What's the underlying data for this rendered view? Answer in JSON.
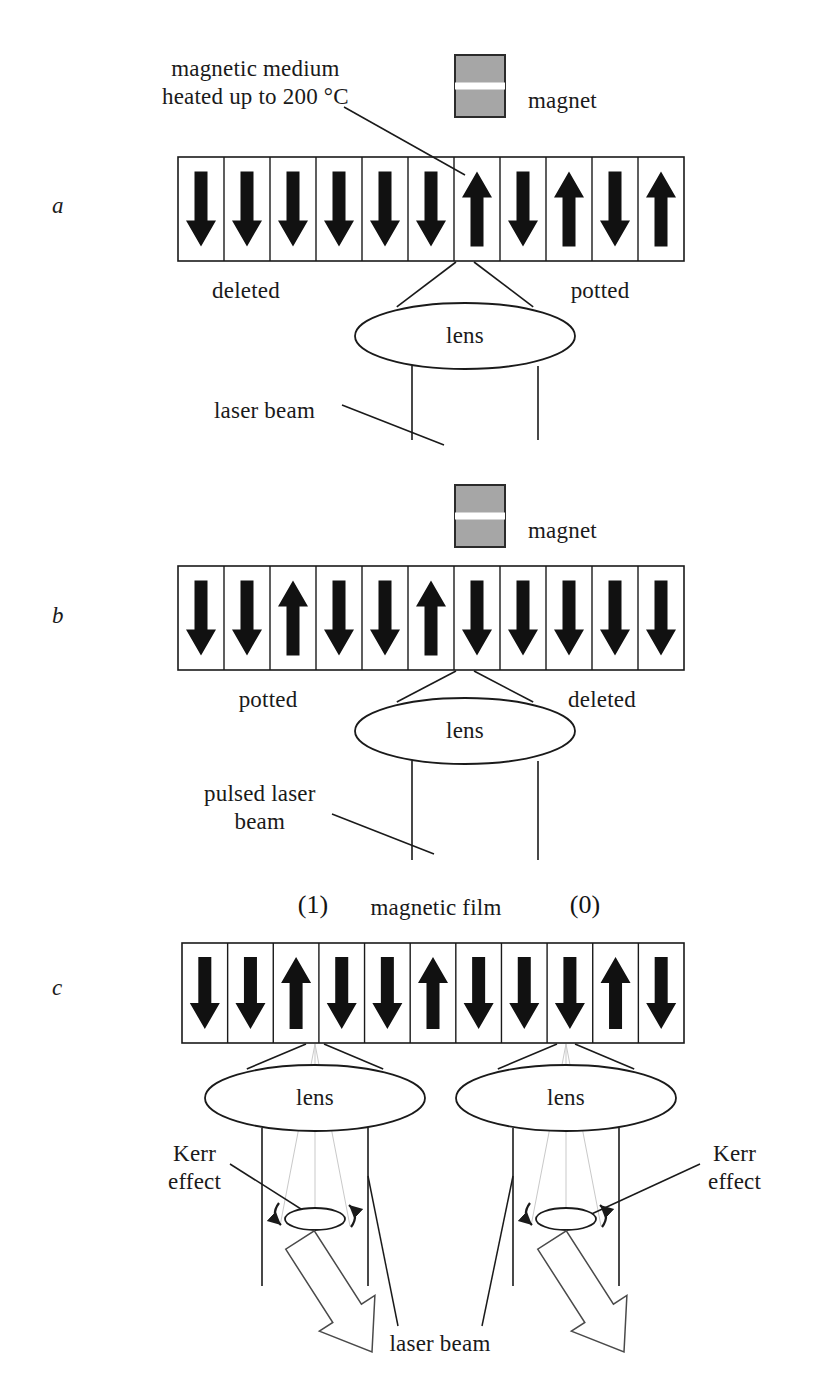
{
  "figure": {
    "background": "#ffffff",
    "ink": "#1a1a1a",
    "magnet_fill": "#a6a6a6",
    "magnet_gap": "#ffffff",
    "arrow_fill": "#111111"
  },
  "panels": [
    {
      "id": "a",
      "letter": "a",
      "letter_pos": {
        "x": 52,
        "y": 193
      },
      "magnet": {
        "label": "magnet",
        "x": 455,
        "y": 55,
        "w": 50,
        "h": 62,
        "label_x": 528,
        "label_y": 87
      },
      "callouts": [
        {
          "name": "magnetic-medium-callout",
          "line1": "magnetic medium",
          "line2": "heated up to 200 °C",
          "x": 162,
          "y": 55
        },
        {
          "name": "laser-beam-callout",
          "text": "laser beam",
          "x": 214,
          "y": 397
        }
      ],
      "row": {
        "x": 178,
        "y": 157,
        "w": 506,
        "h": 104,
        "cells": 11,
        "arrows": [
          "down",
          "down",
          "down",
          "down",
          "down",
          "down",
          "up",
          "down",
          "up",
          "down",
          "up"
        ]
      },
      "zone_labels": [
        {
          "name": "zone-deleted",
          "text": "deleted",
          "x": 246,
          "y": 277
        },
        {
          "name": "zone-potted",
          "text": "potted",
          "x": 600,
          "y": 277
        }
      ],
      "lens": {
        "label": "lens",
        "cx": 465,
        "cy": 336,
        "rx": 110,
        "ry": 33
      },
      "beam": {
        "left_x": 412,
        "right_x": 538,
        "top_y": 366,
        "bottom_y": 440,
        "focus_x": 465,
        "focus_y": 262
      }
    },
    {
      "id": "b",
      "letter": "b",
      "letter_pos": {
        "x": 52,
        "y": 603
      },
      "magnet": {
        "label": "magnet",
        "x": 455,
        "y": 485,
        "w": 50,
        "h": 62,
        "label_x": 528,
        "label_y": 517
      },
      "callouts": [
        {
          "name": "pulsed-laser-beam-callout",
          "line1": "pulsed laser",
          "line2": "beam",
          "x": 204,
          "y": 780
        }
      ],
      "row": {
        "x": 178,
        "y": 566,
        "w": 506,
        "h": 104,
        "cells": 11,
        "arrows": [
          "down",
          "down",
          "up",
          "down",
          "down",
          "up",
          "down",
          "down",
          "down",
          "down",
          "down"
        ]
      },
      "zone_labels": [
        {
          "name": "zone-potted",
          "text": "potted",
          "x": 268,
          "y": 686
        },
        {
          "name": "zone-deleted",
          "text": "deleted",
          "x": 602,
          "y": 686
        }
      ],
      "lens": {
        "label": "lens",
        "cx": 465,
        "cy": 731,
        "rx": 110,
        "ry": 33
      },
      "beam": {
        "left_x": 412,
        "right_x": 538,
        "top_y": 761,
        "bottom_y": 860,
        "focus_x": 465,
        "focus_y": 671
      }
    },
    {
      "id": "c",
      "letter": "c",
      "letter_pos": {
        "x": 52,
        "y": 975
      },
      "headers": [
        {
          "name": "bit-one-label",
          "text": "(1)",
          "x": 313,
          "y": 890
        },
        {
          "name": "magnetic-film-label",
          "text": "magnetic film",
          "x": 436,
          "y": 894
        },
        {
          "name": "bit-zero-label",
          "text": "(0)",
          "x": 585,
          "y": 890
        }
      ],
      "row": {
        "x": 182,
        "y": 943,
        "w": 502,
        "h": 100,
        "cells": 11,
        "arrows": [
          "down",
          "down",
          "up",
          "down",
          "down",
          "up",
          "down",
          "down",
          "down",
          "up",
          "down"
        ]
      },
      "optics": [
        {
          "name": "left-channel",
          "lens": {
            "label": "lens",
            "cx": 315,
            "cy": 1098,
            "rx": 110,
            "ry": 33
          },
          "focus_x": 315,
          "focus_y": 1044,
          "beam": {
            "left_x": 262,
            "right_x": 368,
            "top_y": 1128,
            "bottom_y": 1286
          },
          "kerr": {
            "label_line1": "Kerr",
            "label_line2": "effect",
            "label_x": 168,
            "label_y": 1140,
            "ellipse_cx": 315,
            "ellipse_cy": 1219,
            "ellipse_rx": 30,
            "ellipse_ry": 11
          },
          "out_arrow": {
            "from_x": 300,
            "from_y": 1240,
            "to_x": 372,
            "to_y": 1352
          }
        },
        {
          "name": "right-channel",
          "lens": {
            "label": "lens",
            "cx": 566,
            "cy": 1098,
            "rx": 110,
            "ry": 33
          },
          "focus_x": 566,
          "focus_y": 1044,
          "beam": {
            "left_x": 513,
            "right_x": 619,
            "top_y": 1128,
            "bottom_y": 1286
          },
          "kerr": {
            "label_line1": "Kerr",
            "label_line2": "effect",
            "label_x": 708,
            "label_y": 1140,
            "ellipse_cx": 566,
            "ellipse_cy": 1219,
            "ellipse_rx": 30,
            "ellipse_ry": 11
          },
          "out_arrow": {
            "from_x": 552,
            "from_y": 1240,
            "to_x": 624,
            "to_y": 1352
          }
        }
      ],
      "laser_beam_label": {
        "name": "laser-beam-label",
        "text": "laser beam",
        "x": 440,
        "y": 1330
      }
    }
  ],
  "chart_data": {
    "type": "diagram",
    "rows": [
      {
        "panel": "a",
        "process": "write with magnet and heating laser",
        "magnetization": [
          "down",
          "down",
          "down",
          "down",
          "down",
          "down",
          "up",
          "down",
          "up",
          "down",
          "up"
        ],
        "annotations": [
          "magnetic medium heated up to 200 °C",
          "magnet",
          "deleted",
          "potted",
          "lens",
          "laser beam"
        ]
      },
      {
        "panel": "b",
        "process": "write with pulsed laser beam",
        "magnetization": [
          "down",
          "down",
          "up",
          "down",
          "down",
          "up",
          "down",
          "down",
          "down",
          "down",
          "down"
        ],
        "annotations": [
          "magnet",
          "potted",
          "deleted",
          "lens",
          "pulsed laser beam"
        ]
      },
      {
        "panel": "c",
        "process": "read via Kerr effect",
        "magnetization": [
          "down",
          "down",
          "up",
          "down",
          "down",
          "up",
          "down",
          "down",
          "down",
          "up",
          "down"
        ],
        "annotations": [
          "(1)",
          "magnetic film",
          "(0)",
          "lens",
          "Kerr effect",
          "laser beam"
        ]
      }
    ]
  }
}
